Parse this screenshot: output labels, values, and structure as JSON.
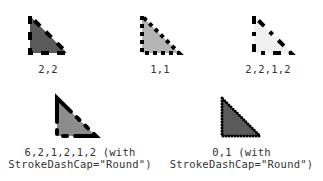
{
  "figure": {
    "colors": {
      "stroke": "#000000",
      "fill_dark": "#5a5a5a",
      "fill_light": "#b4b4b4",
      "fill_very_light": "#f0f0f0",
      "fill_medium": "#8c8c8c",
      "label": "#333333"
    },
    "examples": [
      {
        "id": "dash-2-2",
        "dash_array": "2,2",
        "label": "2,2",
        "cap": "Flat"
      },
      {
        "id": "dash-1-1",
        "dash_array": "1,1",
        "label": "1,1",
        "cap": "Flat"
      },
      {
        "id": "dash-2-2-1-2",
        "dash_array": "2,2,1,2",
        "label": "2,2,1,2",
        "cap": "Flat"
      },
      {
        "id": "dash-6-2-1-2-1-2-round",
        "dash_array": "6,2,1,2,1,2",
        "label_line1": "6,2,1,2,1,2 (with",
        "label_line2": "StrokeDashCap=\"Round\")",
        "cap": "Round"
      },
      {
        "id": "dash-0-1-round",
        "dash_array": "0,1",
        "label_line1": "0,1 (with",
        "label_line2": "StrokeDashCap=\"Round\")",
        "cap": "Round"
      }
    ]
  }
}
